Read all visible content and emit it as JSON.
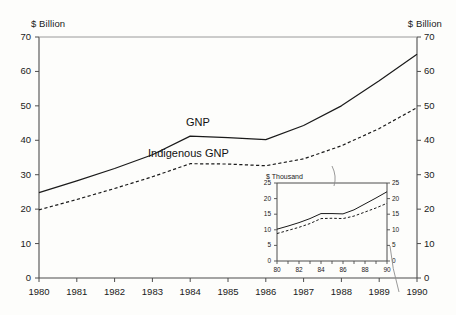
{
  "chart_data": {
    "type": "line",
    "title": "",
    "xlabel": "",
    "ylabel": "$ Billion",
    "ylabel_right": "$ Billion",
    "xlim": [
      1980,
      1990
    ],
    "ylim": [
      0,
      70
    ],
    "grid": false,
    "legend_position": "inline-annotation",
    "categories": [
      1980,
      1981,
      1982,
      1983,
      1984,
      1985,
      1986,
      1987,
      1988,
      1989,
      1990
    ],
    "xtick_labels": [
      "1980",
      "1981",
      "1982",
      "1983",
      "1984",
      "1985",
      "1986",
      "1987",
      "1988",
      "1989",
      "1990"
    ],
    "ytick_labels": [
      "0",
      "10",
      "20",
      "30",
      "40",
      "50",
      "60",
      "70"
    ],
    "ytick_values": [
      0,
      10,
      20,
      30,
      40,
      50,
      60,
      70
    ],
    "series": [
      {
        "name": "GNP",
        "style": "solid",
        "values": [
          24.8,
          28.2,
          31.8,
          35.8,
          41.2,
          40.8,
          40.2,
          44.3,
          50.0,
          57.3,
          65.0
        ]
      },
      {
        "name": "Indigenous GNP",
        "style": "dashed",
        "values": [
          19.8,
          22.8,
          26.0,
          29.4,
          33.2,
          33.1,
          32.6,
          34.6,
          38.4,
          43.4,
          49.5
        ]
      }
    ],
    "inset": {
      "type": "line",
      "ylabel": "$ Thousand",
      "ylabel_right": "$ Thousand",
      "xlim": [
        80,
        90
      ],
      "ylim": [
        0,
        25
      ],
      "grid": false,
      "categories": [
        80,
        81,
        82,
        83,
        84,
        85,
        86,
        87,
        88,
        89,
        90
      ],
      "xtick_labels": [
        "80",
        "82",
        "84",
        "86",
        "88",
        "90"
      ],
      "xtick_values": [
        80,
        82,
        84,
        86,
        88,
        90
      ],
      "ytick_labels": [
        "0",
        "5",
        "10",
        "15",
        "20",
        "25"
      ],
      "ytick_values": [
        0,
        5,
        10,
        15,
        20,
        25
      ],
      "series": [
        {
          "name": "Per Capita GNP",
          "style": "solid",
          "values": [
            10.2,
            11.2,
            12.3,
            13.6,
            15.2,
            15.2,
            15.1,
            16.4,
            18.3,
            20.2,
            22.2
          ]
        },
        {
          "name": "Per Capita Indigenous GNP",
          "style": "dashed",
          "values": [
            8.8,
            9.8,
            10.8,
            12.0,
            13.6,
            13.7,
            13.6,
            14.4,
            15.7,
            17.0,
            18.5
          ]
        }
      ]
    }
  },
  "labels": {
    "unit_left": "$ Billion",
    "unit_right": "$ Billion",
    "series_gnp": "GNP",
    "series_indigenous": "Indigenous GNP",
    "inset_unit": "$ Thousand",
    "inset_series_pc_gnp": "Per Capita GNP",
    "inset_series_pc_indigenous_line1": "Per Capita",
    "inset_series_pc_indigenous_line2": "Indigenous GNP"
  },
  "colors": {
    "line": "#1a1a1a",
    "axis": "#4d4d4d",
    "background": "#fdfdfb"
  }
}
